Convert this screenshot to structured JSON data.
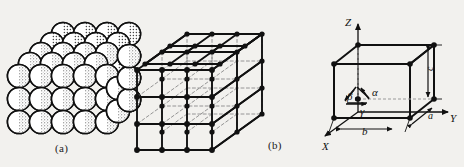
{
  "figure": {
    "background_color": "#f2f1ee",
    "ink_color": "#111111",
    "panels": [
      {
        "id": "a",
        "caption": "(a)",
        "name": "hard-sphere-packing-model",
        "description": "Hard-sphere atomic packing model: stacked spheres in a cubic arrangement",
        "rows": 4,
        "cols": 4,
        "depth_layers": 3
      },
      {
        "id": "b",
        "caption": "(b)",
        "name": "space-lattice-model",
        "description": "Space lattice of points connected by solid (visible) and dashed (hidden) edges",
        "cells_x": 3,
        "cells_y": 3,
        "cells_z": 3
      },
      {
        "id": "c",
        "caption": "",
        "name": "unit-cell-parameters",
        "description": "Unit cell parallelepiped with lattice parameters and interaxial angles"
      }
    ]
  },
  "unit_cell": {
    "axes": [
      {
        "key": "z",
        "label": "Z"
      },
      {
        "key": "y",
        "label": "Y"
      },
      {
        "key": "x",
        "label": "X"
      }
    ],
    "edge_lengths": [
      {
        "key": "a",
        "label": "a"
      },
      {
        "key": "b",
        "label": "b"
      },
      {
        "key": "c",
        "label": "c"
      }
    ],
    "angles": [
      {
        "key": "alpha",
        "label": "α"
      },
      {
        "key": "beta",
        "label": "β"
      },
      {
        "key": "gamma",
        "label": "γ"
      }
    ]
  }
}
